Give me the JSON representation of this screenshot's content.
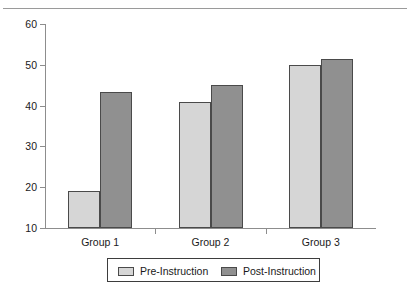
{
  "chart_data": {
    "type": "bar",
    "title": "",
    "xlabel": "",
    "ylabel": "",
    "categories": [
      "Group 1",
      "Group 2",
      "Group 3"
    ],
    "series": [
      {
        "name": "Pre-Instruction",
        "color": "#d6d6d6",
        "values": [
          19,
          41,
          50
        ]
      },
      {
        "name": "Post-Instruction",
        "color": "#909090",
        "values": [
          43.3,
          45,
          51.5
        ]
      }
    ],
    "ylim": [
      10,
      60
    ],
    "yticks": [
      10,
      20,
      30,
      40,
      50,
      60
    ],
    "ytick_labels": [
      "10",
      "20",
      "30",
      "40",
      "50",
      "60"
    ],
    "grid": false,
    "legend_position": "bottom-center",
    "axis_color": "#8d8d8d",
    "bar_edge_color": "#4a4a4a"
  },
  "legend": {
    "entries": [
      {
        "label": "Pre-Instruction"
      },
      {
        "label": "Post-Instruction"
      }
    ]
  }
}
